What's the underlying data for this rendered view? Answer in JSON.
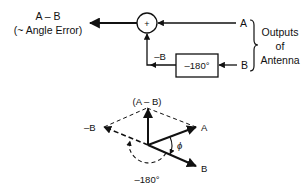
{
  "block_diagram": {
    "output_label_line1": "A – B",
    "output_label_line2": "(~ Angle Error)",
    "summer_symbol": "+",
    "input_a_label": "A",
    "input_b_label": "B",
    "phase_shifter_label": "–180°",
    "inverted_b_label": "–B",
    "group_label_line1": "Outputs",
    "group_label_line2": "of",
    "group_label_line3": "Antenna"
  },
  "phasor_diagram": {
    "difference_label": "(A – B)",
    "vector_a_label": "A",
    "vector_b_label": "B",
    "vector_neg_b_label": "–B",
    "phase_angle_label": "ϕ",
    "rotation_label": "–180°"
  },
  "colors": {
    "stroke": "#111111",
    "background": "#ffffff"
  }
}
